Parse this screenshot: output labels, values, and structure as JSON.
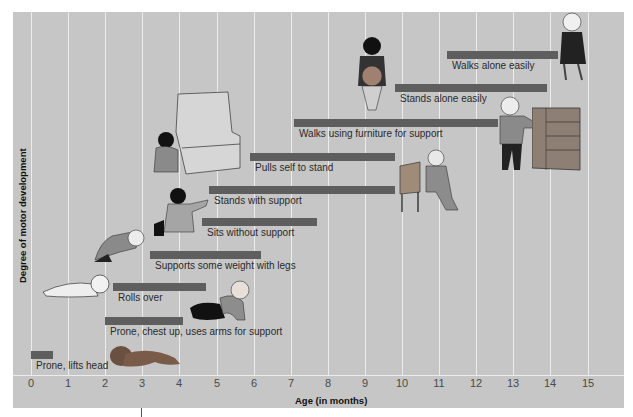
{
  "chart_data": {
    "type": "bar",
    "orientation": "horizontal-range",
    "title": "",
    "xlabel": "Age (in months)",
    "ylabel": "Degree of motor development",
    "xlim": [
      0,
      15.8
    ],
    "x_ticks": [
      "0",
      "1",
      "2",
      "3",
      "4",
      "5",
      "6",
      "7",
      "8",
      "9",
      "10",
      "11",
      "12",
      "13",
      "14",
      "15"
    ],
    "grid": true,
    "legend": null,
    "bar_color": "#5e5e5e",
    "background": "#c6c6c6",
    "milestones": [
      {
        "label": "Prone, lifts head",
        "start": 0.0,
        "end": 0.6
      },
      {
        "label": "Prone, chest up, uses arms for support",
        "start": 2.0,
        "end": 4.1
      },
      {
        "label": "Rolls over",
        "start": 2.2,
        "end": 4.7
      },
      {
        "label": "Supports some weight with legs",
        "start": 3.2,
        "end": 6.2
      },
      {
        "label": "Sits without support",
        "start": 4.6,
        "end": 7.7
      },
      {
        "label": "Stands with support",
        "start": 4.8,
        "end": 9.8
      },
      {
        "label": "Pulls self to stand",
        "start": 5.9,
        "end": 9.8
      },
      {
        "label": "Walks using furniture for support",
        "start": 7.1,
        "end": 12.6
      },
      {
        "label": "Stands alone easily",
        "start": 9.8,
        "end": 13.9
      },
      {
        "label": "Walks alone easily",
        "start": 11.2,
        "end": 14.2
      }
    ]
  },
  "layout": {
    "px_per_month": 37.1,
    "x0": 31,
    "bars_y": [
      351,
      317,
      283,
      251,
      218,
      186,
      153,
      119,
      84,
      51
    ]
  }
}
